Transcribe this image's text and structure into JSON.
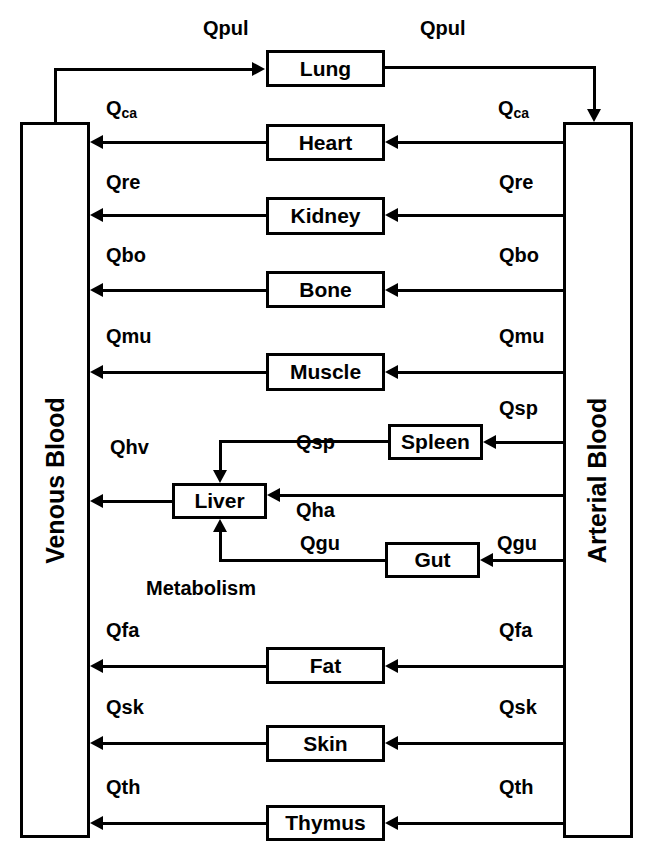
{
  "diagram": {
    "compartments": {
      "venous": {
        "label": "Venous Blood"
      },
      "arterial": {
        "label": "Arterial Blood"
      }
    },
    "organs": [
      {
        "id": "lung",
        "label": "Lung"
      },
      {
        "id": "heart",
        "label": "Heart"
      },
      {
        "id": "kidney",
        "label": "Kidney"
      },
      {
        "id": "bone",
        "label": "Bone"
      },
      {
        "id": "muscle",
        "label": "Muscle"
      },
      {
        "id": "spleen",
        "label": "Spleen"
      },
      {
        "id": "liver",
        "label": "Liver"
      },
      {
        "id": "gut",
        "label": "Gut"
      },
      {
        "id": "fat",
        "label": "Fat"
      },
      {
        "id": "skin",
        "label": "Skin"
      },
      {
        "id": "thymus",
        "label": "Thymus"
      }
    ],
    "flows": {
      "qpul_left": {
        "base": "Qpul",
        "sub": ""
      },
      "qpul_right": {
        "base": "Qpul",
        "sub": ""
      },
      "qca_left": {
        "base": "Q",
        "sub": "ca"
      },
      "qca_right": {
        "base": "Q",
        "sub": "ca"
      },
      "qre_left": {
        "base": "Qre",
        "sub": ""
      },
      "qre_right": {
        "base": "Qre",
        "sub": ""
      },
      "qbo_left": {
        "base": "Qbo",
        "sub": ""
      },
      "qbo_right": {
        "base": "Qbo",
        "sub": ""
      },
      "qmu_left": {
        "base": "Qmu",
        "sub": ""
      },
      "qmu_right": {
        "base": "Qmu",
        "sub": ""
      },
      "qsp_right": {
        "base": "Qsp",
        "sub": ""
      },
      "qsp_left": {
        "base": "Qsp",
        "sub": ""
      },
      "qhv": {
        "base": "Qhv",
        "sub": ""
      },
      "qha": {
        "base": "Qha",
        "sub": ""
      },
      "qgu_left": {
        "base": "Qgu",
        "sub": ""
      },
      "qgu_right": {
        "base": "Qgu",
        "sub": ""
      },
      "qfa_left": {
        "base": "Qfa",
        "sub": ""
      },
      "qfa_right": {
        "base": "Qfa",
        "sub": ""
      },
      "qsk_left": {
        "base": "Qsk",
        "sub": ""
      },
      "qsk_right": {
        "base": "Qsk",
        "sub": ""
      },
      "qth_left": {
        "base": "Qth",
        "sub": ""
      },
      "qth_right": {
        "base": "Qth",
        "sub": ""
      }
    },
    "annotations": {
      "metabolism": "Metabolism"
    },
    "colors": {
      "stroke": "#000000",
      "background": "#ffffff",
      "text": "#000000"
    }
  }
}
